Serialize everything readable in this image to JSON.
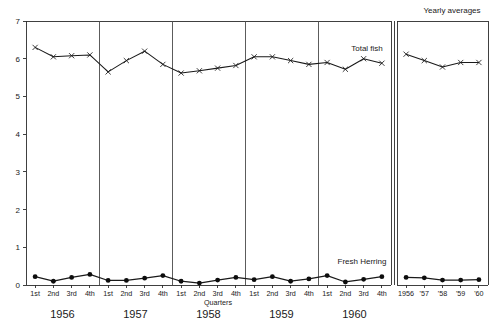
{
  "chart_data": {
    "type": "line",
    "title": "",
    "xlabel": "Quarters",
    "ylabel": "",
    "ylim": [
      0,
      7
    ],
    "yticks": [
      0,
      1,
      2,
      3,
      4,
      5,
      6,
      7
    ],
    "ytick_labels": [
      "0",
      "1",
      "2",
      "3",
      "4",
      "5",
      "6",
      "7"
    ],
    "grid": false,
    "legend_position": "inline-annotation",
    "panels": [
      {
        "name": "quarterly",
        "group_labels": [
          "1956",
          "1957",
          "1958",
          "1959",
          "1960"
        ],
        "categories": [
          "1st",
          "2nd",
          "3rd",
          "4th",
          "1st",
          "2nd",
          "3rd",
          "4th",
          "1st",
          "2nd",
          "3rd",
          "4th",
          "1st",
          "2nd",
          "3rd",
          "4th",
          "1st",
          "2nd",
          "3rd",
          "4th"
        ],
        "series": [
          {
            "name": "Total fish",
            "marker": "x",
            "values": [
              6.3,
              6.05,
              6.08,
              6.1,
              5.65,
              5.95,
              6.2,
              5.85,
              5.62,
              5.68,
              5.75,
              5.82,
              6.05,
              6.05,
              5.95,
              5.85,
              5.9,
              5.72,
              6.0,
              5.88
            ]
          },
          {
            "name": "Fresh Herring",
            "marker": "dot",
            "values": [
              0.22,
              0.1,
              0.2,
              0.28,
              0.12,
              0.12,
              0.18,
              0.25,
              0.1,
              0.05,
              0.13,
              0.2,
              0.14,
              0.22,
              0.1,
              0.16,
              0.25,
              0.08,
              0.15,
              0.22
            ]
          }
        ]
      },
      {
        "name": "yearly_averages",
        "title": "Yearly averages",
        "categories": [
          "1956",
          "'57",
          "'58",
          "'59",
          "'60"
        ],
        "series": [
          {
            "name": "Total fish",
            "marker": "x",
            "values": [
              6.12,
              5.95,
              5.78,
              5.9,
              5.9
            ]
          },
          {
            "name": "Fresh Herring",
            "marker": "dot",
            "values": [
              0.2,
              0.19,
              0.13,
              0.13,
              0.14
            ]
          }
        ]
      }
    ],
    "annotations": [
      {
        "text": "Total fish",
        "series": "Total fish"
      },
      {
        "text": "Fresh Herring",
        "series": "Fresh Herring"
      }
    ],
    "colors": {
      "line": "#1a1a1a",
      "frame": "#2b2b2b",
      "background": "#ffffff"
    }
  },
  "labels": {
    "axis_title": "Quarters",
    "yearly_averages_title": "Yearly averages",
    "total_fish": "Total fish",
    "fresh_herring": "Fresh Herring"
  }
}
